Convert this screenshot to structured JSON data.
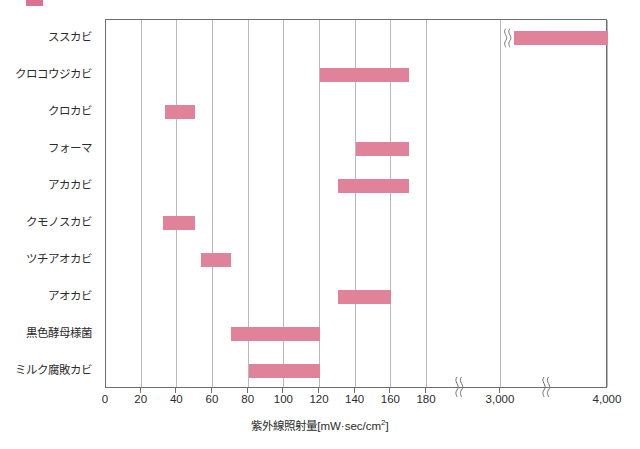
{
  "legend": {
    "swatch_color": "#d9738f",
    "text": ""
  },
  "chart_data": {
    "type": "bar",
    "orientation": "horizontal-range",
    "title": "",
    "xlabel": "紫外線照射量[mW·sec/cm2]",
    "xlabel_main": "紫外線照射量",
    "xlabel_unit_open": "[mW·sec/cm",
    "xlabel_unit_exp": "2",
    "xlabel_unit_close": "]",
    "ylabel": "",
    "grid": true,
    "legend_position": "top-left",
    "bar_color": "#e0829a",
    "axis_break_count": 2,
    "xticks": [
      "0",
      "20",
      "40",
      "60",
      "80",
      "100",
      "120",
      "140",
      "160",
      "180",
      "3,000",
      "4,000"
    ],
    "xtick_values": [
      0,
      20,
      40,
      60,
      80,
      100,
      120,
      140,
      160,
      180,
      3000,
      4000
    ],
    "categories": [
      "ススカビ",
      "クロコウジカビ",
      "クロカビ",
      "フォーマ",
      "アカカビ",
      "クモノスカビ",
      "ツチアオカビ",
      "アオカビ",
      "黒色酵母様菌",
      "ミルク腐敗カビ"
    ],
    "ranges": [
      {
        "category": "ススカビ",
        "low": 3000,
        "high": 4000,
        "has_break": true
      },
      {
        "category": "クロコウジカビ",
        "low": 120,
        "high": 170,
        "has_break": false
      },
      {
        "category": "クロカビ",
        "low": 33,
        "high": 50,
        "has_break": false
      },
      {
        "category": "フォーマ",
        "low": 140,
        "high": 170,
        "has_break": false
      },
      {
        "category": "アカカビ",
        "low": 130,
        "high": 170,
        "has_break": false
      },
      {
        "category": "クモノスカビ",
        "low": 32,
        "high": 50,
        "has_break": false
      },
      {
        "category": "ツチアオカビ",
        "low": 53,
        "high": 70,
        "has_break": false
      },
      {
        "category": "アオカビ",
        "low": 130,
        "high": 160,
        "has_break": false
      },
      {
        "category": "黒色酵母様菌",
        "low": 70,
        "high": 120,
        "has_break": false
      },
      {
        "category": "ミルク腐敗カビ",
        "low": 80,
        "high": 120,
        "has_break": false
      }
    ]
  }
}
